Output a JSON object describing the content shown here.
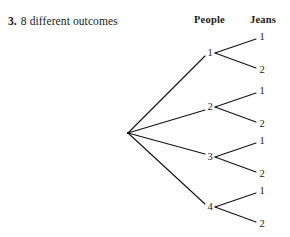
{
  "answer": {
    "number": "3.",
    "text": "8 different outcomes"
  },
  "columns": {
    "stage1_header": "People",
    "stage2_header": "Jeans"
  },
  "colors": {
    "background": "#ffffff",
    "ink": "#1a1a1a",
    "line": "#111111"
  },
  "chart_data": {
    "type": "diagram",
    "diagram_type": "tree",
    "title": "",
    "levels": [
      "People",
      "Jeans"
    ],
    "total_outcomes": 8,
    "root": {
      "label": "",
      "x": 128,
      "y": 133
    },
    "stage1": [
      {
        "label": "1",
        "x": 210,
        "y": 53
      },
      {
        "label": "2",
        "x": 210,
        "y": 107
      },
      {
        "label": "3",
        "x": 210,
        "y": 157
      },
      {
        "label": "4",
        "x": 210,
        "y": 207
      }
    ],
    "stage2": [
      {
        "parent": "1",
        "label": "1",
        "x": 262,
        "y": 37
      },
      {
        "parent": "1",
        "label": "2",
        "x": 262,
        "y": 70
      },
      {
        "parent": "2",
        "label": "1",
        "x": 262,
        "y": 91
      },
      {
        "parent": "2",
        "label": "2",
        "x": 262,
        "y": 124
      },
      {
        "parent": "3",
        "label": "1",
        "x": 262,
        "y": 141
      },
      {
        "parent": "3",
        "label": "2",
        "x": 262,
        "y": 174
      },
      {
        "parent": "4",
        "label": "1",
        "x": 262,
        "y": 191
      },
      {
        "parent": "4",
        "label": "2",
        "x": 262,
        "y": 224
      }
    ],
    "outcomes": [
      "1-1",
      "1-2",
      "2-1",
      "2-2",
      "3-1",
      "3-2",
      "4-1",
      "4-2"
    ]
  }
}
